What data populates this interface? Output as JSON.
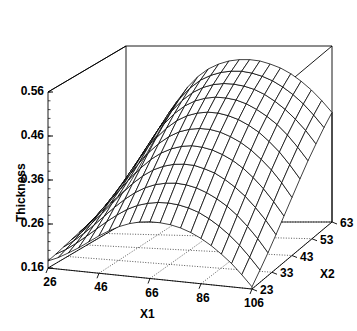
{
  "chart_data": {
    "type": "surface",
    "title": "",
    "xlabel": "X1",
    "ylabel": "X2",
    "zlabel": "Thickness",
    "grid": true,
    "legend": false,
    "style": "wireframe-mesh",
    "line_color": "#000000",
    "background_color": "#ffffff",
    "xlim": [
      26,
      106
    ],
    "ylim": [
      23,
      63
    ],
    "zlim": [
      0.16,
      0.56
    ],
    "xticks": [
      26,
      46,
      66,
      86,
      106
    ],
    "yticks": [
      23,
      33,
      43,
      53,
      63
    ],
    "zticks": [
      0.16,
      0.26,
      0.36,
      0.46,
      0.56
    ],
    "xtick_labels": [
      "26",
      "46",
      "66",
      "86",
      "106"
    ],
    "ytick_labels": [
      "23",
      "33",
      "43",
      "53",
      "63"
    ],
    "ztick_labels": [
      "0.16",
      "0.26",
      "0.36",
      "0.46",
      "0.56"
    ],
    "x": [
      26,
      30,
      34,
      38,
      42,
      46,
      50,
      54,
      58,
      62,
      66,
      70,
      74,
      78,
      82,
      86,
      90,
      94,
      98,
      102,
      106
    ],
    "y": [
      23,
      27,
      31,
      35,
      39,
      43,
      47,
      51,
      55,
      59,
      63
    ],
    "z": [
      [
        0.176,
        0.181,
        0.187,
        0.193,
        0.199,
        0.205,
        0.211,
        0.217,
        0.223,
        0.229,
        0.235
      ],
      [
        0.186,
        0.194,
        0.203,
        0.212,
        0.221,
        0.23,
        0.239,
        0.248,
        0.257,
        0.266,
        0.274
      ],
      [
        0.199,
        0.21,
        0.222,
        0.234,
        0.246,
        0.258,
        0.27,
        0.282,
        0.293,
        0.304,
        0.315
      ],
      [
        0.213,
        0.228,
        0.243,
        0.258,
        0.273,
        0.288,
        0.303,
        0.318,
        0.332,
        0.345,
        0.357
      ],
      [
        0.229,
        0.247,
        0.265,
        0.283,
        0.301,
        0.319,
        0.337,
        0.354,
        0.37,
        0.385,
        0.398
      ],
      [
        0.245,
        0.266,
        0.287,
        0.308,
        0.329,
        0.35,
        0.37,
        0.389,
        0.406,
        0.422,
        0.436
      ],
      [
        0.259,
        0.283,
        0.307,
        0.331,
        0.354,
        0.377,
        0.399,
        0.419,
        0.437,
        0.453,
        0.467
      ],
      [
        0.271,
        0.298,
        0.324,
        0.35,
        0.375,
        0.399,
        0.422,
        0.443,
        0.461,
        0.477,
        0.491
      ],
      [
        0.28,
        0.309,
        0.337,
        0.365,
        0.391,
        0.416,
        0.44,
        0.461,
        0.479,
        0.495,
        0.508
      ],
      [
        0.286,
        0.316,
        0.346,
        0.375,
        0.402,
        0.428,
        0.452,
        0.473,
        0.491,
        0.506,
        0.519
      ],
      [
        0.289,
        0.32,
        0.351,
        0.381,
        0.409,
        0.435,
        0.459,
        0.48,
        0.498,
        0.513,
        0.526
      ],
      [
        0.289,
        0.321,
        0.353,
        0.383,
        0.412,
        0.438,
        0.462,
        0.483,
        0.501,
        0.516,
        0.529
      ],
      [
        0.287,
        0.319,
        0.351,
        0.382,
        0.41,
        0.437,
        0.461,
        0.482,
        0.5,
        0.516,
        0.529
      ],
      [
        0.282,
        0.314,
        0.346,
        0.376,
        0.405,
        0.432,
        0.456,
        0.478,
        0.496,
        0.512,
        0.526
      ],
      [
        0.274,
        0.306,
        0.337,
        0.368,
        0.396,
        0.423,
        0.448,
        0.47,
        0.489,
        0.505,
        0.519
      ],
      [
        0.263,
        0.294,
        0.325,
        0.355,
        0.384,
        0.411,
        0.436,
        0.458,
        0.478,
        0.495,
        0.51
      ],
      [
        0.249,
        0.279,
        0.31,
        0.339,
        0.368,
        0.395,
        0.421,
        0.443,
        0.463,
        0.481,
        0.497
      ],
      [
        0.232,
        0.261,
        0.291,
        0.32,
        0.348,
        0.375,
        0.401,
        0.425,
        0.445,
        0.464,
        0.48
      ],
      [
        0.213,
        0.24,
        0.268,
        0.296,
        0.324,
        0.352,
        0.378,
        0.402,
        0.423,
        0.443,
        0.46
      ],
      [
        0.19,
        0.215,
        0.242,
        0.269,
        0.296,
        0.324,
        0.35,
        0.375,
        0.398,
        0.418,
        0.436
      ],
      [
        0.165,
        0.188,
        0.212,
        0.238,
        0.265,
        0.292,
        0.319,
        0.345,
        0.368,
        0.39,
        0.409
      ]
    ]
  },
  "axes": {
    "z_title": "Thickness",
    "x_title": "X1",
    "y_title": "X2"
  }
}
